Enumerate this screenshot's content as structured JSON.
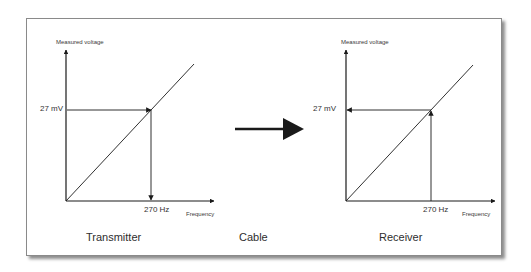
{
  "diagram": {
    "transmitter": {
      "caption": "Transmitter",
      "y_axis_label": "Measured voltage",
      "x_axis_label": "Frequency",
      "voltage_marker": "27 mV",
      "frequency_marker": "270 Hz",
      "flow": "voltage to frequency"
    },
    "cable": {
      "caption": "Cable"
    },
    "receiver": {
      "caption": "Receiver",
      "y_axis_label": "Measured voltage",
      "x_axis_label": "Frequency",
      "voltage_marker": "27 mV",
      "frequency_marker": "270 Hz",
      "flow": "frequency to voltage"
    },
    "colors": {
      "line": "#1a1a1a",
      "frame_border": "#8a8a8a",
      "background": "#ffffff"
    }
  }
}
